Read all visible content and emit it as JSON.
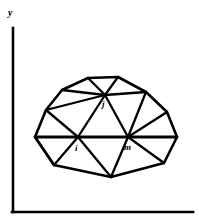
{
  "figure": {
    "background_color": "#ffffff",
    "line_color": "#000000",
    "width": 199,
    "height": 223
  },
  "axes": {
    "y_axis_label": "y",
    "x_axis_label": "",
    "y_axis": {
      "x": 13,
      "y_top": 28,
      "y_bottom": 212
    },
    "x_axis": {
      "y": 212,
      "x_left": 12,
      "x_right": 193
    },
    "y_label_position": {
      "x": 9,
      "y": 15
    }
  },
  "mesh": {
    "type": "triangulated-polygon",
    "vertices": [
      {
        "id": "b0",
        "label": "",
        "x": 35,
        "y": 137
      },
      {
        "id": "b1",
        "label": "",
        "x": 46,
        "y": 110
      },
      {
        "id": "b2",
        "label": "",
        "x": 62,
        "y": 90
      },
      {
        "id": "b3",
        "label": "",
        "x": 88,
        "y": 78
      },
      {
        "id": "b4",
        "label": "",
        "x": 118,
        "y": 77
      },
      {
        "id": "b5",
        "label": "",
        "x": 146,
        "y": 92
      },
      {
        "id": "b6",
        "label": "",
        "x": 167,
        "y": 112
      },
      {
        "id": "b7",
        "label": "",
        "x": 177,
        "y": 137
      },
      {
        "id": "b8",
        "label": "",
        "x": 164,
        "y": 163
      },
      {
        "id": "b9",
        "label": "",
        "x": 111,
        "y": 177
      },
      {
        "id": "b10",
        "label": "",
        "x": 54,
        "y": 165
      },
      {
        "id": "j",
        "label": "j",
        "x": 105,
        "y": 95
      },
      {
        "id": "i",
        "label": "i",
        "x": 78,
        "y": 137
      },
      {
        "id": "m",
        "label": "m",
        "x": 128,
        "y": 137
      }
    ],
    "labels": [
      {
        "text": "j",
        "x": 104,
        "y": 106
      },
      {
        "text": "i",
        "x": 77,
        "y": 150
      },
      {
        "text": "m",
        "x": 126,
        "y": 150
      }
    ],
    "boundary_path": "M 35 137 L 46 110 L 62 90 L 88 78 L 118 77 L 146 92 L 167 112 L 177 137 L 164 163 L 111 177 L 54 165 Z",
    "chord_path": "M 35 137 L 177 137",
    "interior_edges": [
      "M 62 90 L 105 95",
      "M 88 78 L 105 95",
      "M 118 77 L 105 95",
      "M 146 92 L 105 95",
      "M 46 110 L 105 95",
      "M 105 95 L 78 137",
      "M 105 95 L 128 137",
      "M 46 110 L 78 137",
      "M 146 92 L 128 137",
      "M 167 112 L 128 137",
      "M 78 137 L 54 165",
      "M 78 137 L 111 177",
      "M 128 137 L 111 177",
      "M 128 137 L 164 163",
      "M 35 137 L 54 165"
    ]
  }
}
